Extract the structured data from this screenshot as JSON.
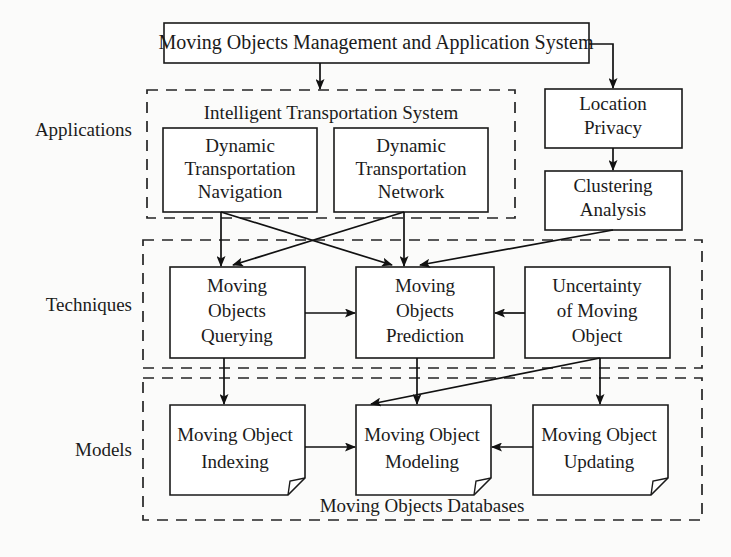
{
  "diagram": {
    "title": "Moving Objects Management and Application System",
    "tiers": [
      {
        "id": "applications",
        "label": "Applications"
      },
      {
        "id": "techniques",
        "label": "Techniques"
      },
      {
        "id": "models",
        "label": "Models"
      }
    ],
    "regions": [
      {
        "id": "its",
        "title": "Intelligent Transportation System"
      },
      {
        "id": "mod",
        "title": "Moving Objects Databases"
      }
    ],
    "nodes": {
      "root": {
        "label": "Moving Objects Management and Application System"
      },
      "dyn_nav": {
        "line1": "Dynamic",
        "line2": "Transportation",
        "line3": "Navigation"
      },
      "dyn_net": {
        "line1": "Dynamic",
        "line2": "Transportation",
        "line3": "Network"
      },
      "loc_privacy": {
        "line1": "Location",
        "line2": "Privacy"
      },
      "clustering": {
        "line1": "Clustering",
        "line2": "Analysis"
      },
      "mo_query": {
        "line1": "Moving",
        "line2": "Objects",
        "line3": "Querying"
      },
      "mo_predict": {
        "line1": "Moving",
        "line2": "Objects",
        "line3": "Prediction"
      },
      "uncertainty": {
        "line1": "Uncertainty",
        "line2": "of Moving",
        "line3": "Object"
      },
      "mo_indexing": {
        "line1": "Moving Object",
        "line2": "Indexing"
      },
      "mo_modeling": {
        "line1": "Moving Object",
        "line2": "Modeling"
      },
      "mo_updating": {
        "line1": "Moving Object",
        "line2": "Updating"
      }
    },
    "colors": {
      "background": "#fbfbfa",
      "stroke": "#1a1a1a",
      "text": "#1b1b1b",
      "box_fill": "#ffffff"
    }
  }
}
